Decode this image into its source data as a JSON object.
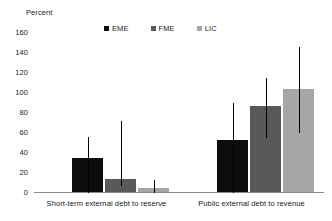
{
  "chart_data": {
    "type": "bar",
    "title": "",
    "subtitle": "",
    "xlabel": "",
    "ylabel": "Percent",
    "ylim": [
      0,
      160
    ],
    "yticks": [
      160,
      140,
      120,
      100,
      80,
      60,
      40,
      20,
      0
    ],
    "grid": false,
    "legend_position": "top-center",
    "categories": [
      "Short-term external debt to reserve",
      "Public external debt to revenue"
    ],
    "series": [
      {
        "name": "EME",
        "color": "#0d0d0d",
        "values": [
          34,
          52
        ],
        "error_high": [
          56,
          90
        ],
        "error_low": [
          0,
          0
        ]
      },
      {
        "name": "FME",
        "color": "#595959",
        "values": [
          13,
          86
        ],
        "error_high": [
          72,
          115
        ],
        "error_low": [
          7,
          55
        ]
      },
      {
        "name": "LIC",
        "color": "#a6a6a6",
        "values": [
          4,
          103
        ],
        "error_high": [
          13,
          146
        ],
        "error_low": [
          0,
          60
        ]
      }
    ]
  },
  "axis": {
    "y_title": "Percent"
  },
  "legend": {
    "items": [
      {
        "label": "EME",
        "color": "#0d0d0d"
      },
      {
        "label": "FME",
        "color": "#595959"
      },
      {
        "label": "LIC",
        "color": "#a6a6a6"
      }
    ]
  },
  "ytick_labels": [
    "160",
    "140",
    "120",
    "100",
    "80",
    "60",
    "40",
    "20",
    "0"
  ],
  "category_labels": [
    "Short-term external debt to reserve",
    "Public external debt to revenue"
  ]
}
